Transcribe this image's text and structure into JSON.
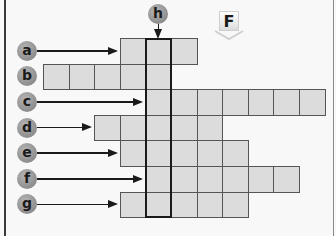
{
  "diagram": {
    "type": "crossword-grid",
    "marker_label": "F",
    "column_label": "h",
    "cell_size": 25.6,
    "grid_origin_x": 43,
    "grid_origin_y": 38,
    "highlight_column_index": 4,
    "colors": {
      "cell_fill": "#dcdcdc",
      "cell_border": "#555555",
      "badge_fill": "#9a9a9a",
      "arrow": "#1a1a1a",
      "background": "#f8f8f8"
    },
    "rows": [
      {
        "label": "a",
        "start_col": 3,
        "length": 3,
        "has_arrow": true
      },
      {
        "label": "b",
        "start_col": 0,
        "length": 5,
        "has_arrow": false
      },
      {
        "label": "c",
        "start_col": 4,
        "length": 7,
        "has_arrow": true
      },
      {
        "label": "d",
        "start_col": 2,
        "length": 5,
        "has_arrow": true
      },
      {
        "label": "e",
        "start_col": 3,
        "length": 5,
        "has_arrow": true
      },
      {
        "label": "f",
        "start_col": 4,
        "length": 6,
        "has_arrow": true
      },
      {
        "label": "g",
        "start_col": 3,
        "length": 5,
        "has_arrow": true
      }
    ]
  }
}
